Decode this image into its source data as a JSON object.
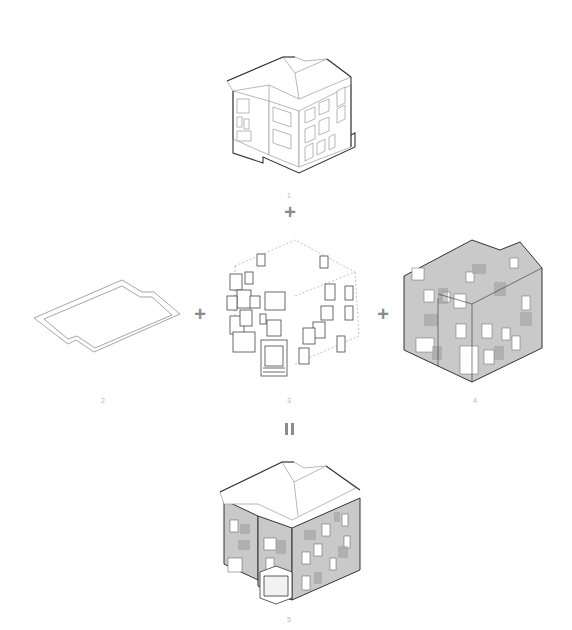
{
  "diagram": {
    "type": "axonometric assembly diagram",
    "components": [
      {
        "id": "existing-house",
        "label": "1",
        "description": "Existing three-storey house, line drawing with hipped roof"
      },
      {
        "id": "floor-plate",
        "label": "2",
        "description": "Footprint outline / ground slab"
      },
      {
        "id": "inserted-volumes",
        "label": "3",
        "description": "Exploded boxes / window frames and entrance volume within dashed bounding box"
      },
      {
        "id": "new-walls",
        "label": "4",
        "description": "Grey textured wall shell with openings"
      },
      {
        "id": "result-house",
        "label": "5",
        "description": "Combined result: house with new grey textured facade, roof and entrance box"
      }
    ],
    "operators": {
      "plus_1": "+",
      "plus_2": "+",
      "plus_3": "+",
      "equals": "="
    },
    "colors": {
      "line": "#333333",
      "light_line": "#9a9a9a",
      "wall_fill": "#c9c9c9",
      "label": "#b8b8b8",
      "operator": "#8a8a8a"
    }
  }
}
